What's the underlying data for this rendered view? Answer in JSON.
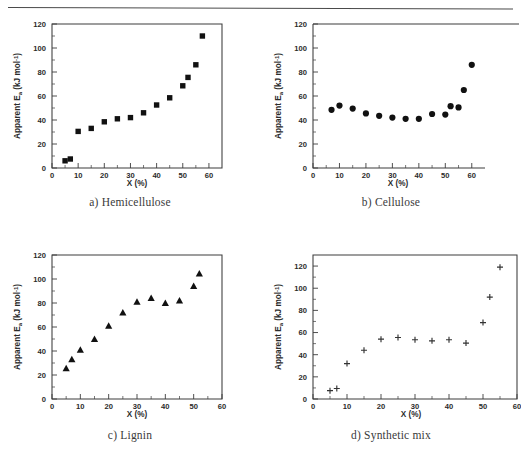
{
  "figure": {
    "axis_titles": {
      "x": "X (%)",
      "y": "Apparent E",
      "y_sub": "a",
      "y_unit": " (kJ mol-1)"
    },
    "x_ticks": [
      "0",
      "10",
      "20",
      "30",
      "40",
      "50",
      "60"
    ],
    "y_ticks": [
      "0",
      "20",
      "40",
      "60",
      "80",
      "100",
      "120"
    ],
    "colors": {
      "marker": "#111111",
      "axis": "#3c3c3c",
      "text": "#2b2b2b"
    }
  },
  "chart_data": [
    {
      "type": "scatter",
      "panel": "a",
      "title": "a) Hemicellulose",
      "xlabel": "X (%)",
      "ylabel": "Apparent Ea (kJ mol-1)",
      "xlim": [
        0,
        65
      ],
      "ylim": [
        0,
        120
      ],
      "xticks": [
        0,
        10,
        20,
        30,
        40,
        50,
        60
      ],
      "yticks": [
        0,
        20,
        40,
        60,
        80,
        100,
        120
      ],
      "grid": false,
      "legend": "none",
      "marker": "square",
      "x": [
        5,
        7,
        10,
        15,
        20,
        25,
        30,
        35,
        40,
        45,
        50,
        52,
        55,
        57.5
      ],
      "y": [
        6,
        7.5,
        30.5,
        33,
        38.5,
        41,
        42,
        46,
        52.5,
        58.5,
        68.5,
        75.5,
        86,
        110
      ]
    },
    {
      "type": "scatter",
      "panel": "b",
      "title": "b) Cellulose",
      "xlabel": "X (%)",
      "ylabel": "Apparent Ea (kJ mol-1)",
      "xlim": [
        0,
        65
      ],
      "ylim": [
        0,
        120
      ],
      "xticks": [
        0,
        10,
        20,
        30,
        40,
        50,
        60
      ],
      "yticks": [
        0,
        20,
        40,
        60,
        80,
        100,
        120
      ],
      "grid": false,
      "legend": "none",
      "marker": "circle",
      "x": [
        7,
        10,
        15,
        20,
        25,
        30,
        35,
        40,
        45,
        50,
        52,
        55,
        57,
        60
      ],
      "y": [
        48.5,
        52,
        49.5,
        45.5,
        43.5,
        42,
        41,
        41,
        45,
        44.5,
        51.5,
        50.5,
        65,
        86
      ]
    },
    {
      "type": "scatter",
      "panel": "c",
      "title": "c) Lignin",
      "xlabel": "X (%)",
      "ylabel": "Apparent Ea (kJ mol-1)",
      "xlim": [
        0,
        60
      ],
      "ylim": [
        0,
        120
      ],
      "xticks": [
        0,
        10,
        20,
        30,
        40,
        50,
        60
      ],
      "yticks": [
        0,
        20,
        40,
        60,
        80,
        100,
        120
      ],
      "grid": false,
      "legend": "none",
      "marker": "triangle",
      "x": [
        5,
        7,
        10,
        15,
        20,
        25,
        30,
        35,
        40,
        45,
        50,
        52
      ],
      "y": [
        25.5,
        33,
        41,
        50,
        61,
        72,
        81,
        84,
        80,
        82,
        94,
        104.5
      ]
    },
    {
      "type": "scatter",
      "panel": "d",
      "title": "d) Synthetic mix",
      "xlabel": "X (%)",
      "ylabel": "Apparent Ea (kJ mol-1)",
      "xlim": [
        0,
        60
      ],
      "ylim": [
        0,
        130
      ],
      "xticks": [
        0,
        10,
        20,
        30,
        40,
        50,
        60
      ],
      "yticks": [
        0,
        20,
        40,
        60,
        80,
        100,
        120
      ],
      "grid": false,
      "legend": "none",
      "marker": "plus",
      "x": [
        5,
        7,
        10,
        15,
        20,
        25,
        30,
        35,
        40,
        45,
        50,
        52,
        55
      ],
      "y": [
        7.5,
        9.5,
        32,
        44,
        54,
        55.5,
        53.5,
        52.5,
        53.5,
        50.5,
        69,
        92,
        119
      ]
    }
  ],
  "captions": {
    "a": "a) Hemicellulose",
    "b": "b) Cellulose",
    "c": "c) Lignin",
    "d": "d) Synthetic mix"
  },
  "tick_labels": {
    "x": [
      "0",
      "10",
      "20",
      "30",
      "40",
      "50",
      "60"
    ],
    "y": [
      "0",
      "20",
      "40",
      "60",
      "80",
      "100",
      "120"
    ]
  }
}
